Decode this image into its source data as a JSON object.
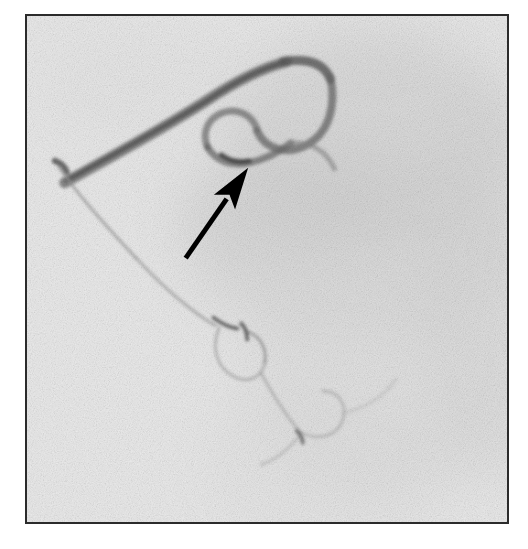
{
  "viewer": {
    "width": 528,
    "height": 549,
    "background_color": "#ffffff",
    "modality_label": "digital-subtraction-angiography"
  },
  "film": {
    "frame_left": 25,
    "frame_top": 14,
    "frame_width": 484,
    "frame_height": 510,
    "border_color": "#2b2b2b",
    "border_width": 2,
    "base_color": "#ececec",
    "grain_opacity": 0.38,
    "grain_seed": 20250817,
    "view_box": "0 0 484 510"
  },
  "soft_tissue_regions": [
    {
      "name": "upper-right-soft-tissue-shadow",
      "cx": 350,
      "cy": 120,
      "rx": 150,
      "ry": 110,
      "color": "#cfcfcf",
      "opacity": 0.55
    },
    {
      "name": "mid-right-soft-tissue-band",
      "cx": 330,
      "cy": 230,
      "rx": 175,
      "ry": 95,
      "color": "#d4d4d4",
      "opacity": 0.5
    },
    {
      "name": "lower-right-soft-tissue-mass",
      "cx": 360,
      "cy": 360,
      "rx": 140,
      "ry": 130,
      "color": "#dcdcdc",
      "opacity": 0.45
    },
    {
      "name": "right-margin-shadow",
      "cx": 470,
      "cy": 270,
      "rx": 80,
      "ry": 200,
      "color": "#d8d8d8",
      "opacity": 0.4
    },
    {
      "name": "central-diagonal-shadow",
      "cx": 255,
      "cy": 190,
      "rx": 110,
      "ry": 60,
      "color": "#d2d2d2",
      "opacity": 0.4
    },
    {
      "name": "lower-central-shadow",
      "cx": 300,
      "cy": 450,
      "rx": 120,
      "ry": 80,
      "color": "#e0e0e0",
      "opacity": 0.4
    },
    {
      "name": "upper-left-faint-shadow",
      "cx": 120,
      "cy": 70,
      "rx": 110,
      "ry": 55,
      "color": "#e2e2e2",
      "opacity": 0.35
    }
  ],
  "vessels": [
    {
      "name": "main-catheter-ascending-limb",
      "path": "M 38 168 C 70 150, 130 118, 180 86 C 210 66, 238 52, 262 46",
      "stroke": "#6e6e6e",
      "width": 11,
      "opacity": 0.78
    },
    {
      "name": "main-catheter-ascending-limb-core",
      "path": "M 40 166 C 72 148, 132 116, 182 85 C 212 65, 238 52, 260 47",
      "stroke": "#555555",
      "width": 5,
      "opacity": 0.8
    },
    {
      "name": "catheter-apex-curve",
      "path": "M 258 46 C 284 42, 300 48, 306 64",
      "stroke": "#5a5a5a",
      "width": 9,
      "opacity": 0.82
    },
    {
      "name": "catheter-descending-loop-outer",
      "path": "M 306 62 C 312 92, 304 118, 282 130 C 262 141, 240 134, 232 116",
      "stroke": "#6a6a6a",
      "width": 8,
      "opacity": 0.76
    },
    {
      "name": "catheter-inner-loop-return",
      "path": "M 232 114 C 226 98, 210 92, 196 98 C 182 104, 176 118, 182 132",
      "stroke": "#707070",
      "width": 7,
      "opacity": 0.72
    },
    {
      "name": "loop-junction-segment",
      "path": "M 182 132 C 190 146, 206 152, 224 148 C 242 144, 256 136, 266 128",
      "stroke": "#6b6b6b",
      "width": 7,
      "opacity": 0.74
    },
    {
      "name": "junction-dense-node",
      "path": "M 196 140 C 204 146, 214 148, 224 146",
      "stroke": "#3f3f3f",
      "width": 5,
      "opacity": 0.85
    },
    {
      "name": "distal-branch-from-junction",
      "path": "M 264 128 C 286 126, 302 136, 310 154",
      "stroke": "#888888",
      "width": 5,
      "opacity": 0.6
    },
    {
      "name": "left-proximal-dense-point",
      "path": "M 28 146 C 34 148, 38 152, 40 157",
      "stroke": "#4a4a4a",
      "width": 6,
      "opacity": 0.8
    },
    {
      "name": "thin-descending-vessel-upper",
      "path": "M 32 152 C 48 176, 78 210, 110 244",
      "stroke": "#9a9a9a",
      "width": 3,
      "opacity": 0.72
    },
    {
      "name": "thin-descending-vessel-lower",
      "path": "M 110 244 C 138 274, 166 298, 190 312",
      "stroke": "#9e9e9e",
      "width": 3,
      "opacity": 0.68
    },
    {
      "name": "vessel-branch-node-midline",
      "path": "M 188 304 C 196 310, 204 314, 212 315",
      "stroke": "#555555",
      "width": 4,
      "opacity": 0.8
    },
    {
      "name": "lower-loop-left-branch",
      "path": "M 194 314 C 186 332, 190 352, 206 362 C 222 372, 238 364, 240 348",
      "stroke": "#a5a5a5",
      "width": 3,
      "opacity": 0.65
    },
    {
      "name": "lower-loop-left-branch-return",
      "path": "M 240 348 C 242 334, 234 322, 222 318",
      "stroke": "#8e8e8e",
      "width": 3,
      "opacity": 0.7
    },
    {
      "name": "lower-branch-dense-marker",
      "path": "M 216 310 C 220 314, 222 320, 222 326",
      "stroke": "#4f4f4f",
      "width": 4,
      "opacity": 0.78
    },
    {
      "name": "lower-descending-trunk",
      "path": "M 236 360 C 248 382, 262 404, 276 420",
      "stroke": "#a8a8a8",
      "width": 3,
      "opacity": 0.62
    },
    {
      "name": "lower-loop-right-branch",
      "path": "M 276 420 C 294 428, 312 424, 318 408 C 324 392, 314 378, 298 378",
      "stroke": "#aaaaaa",
      "width": 3,
      "opacity": 0.6
    },
    {
      "name": "lower-terminal-branch",
      "path": "M 274 424 C 262 438, 250 448, 236 452",
      "stroke": "#b0b0b0",
      "width": 3,
      "opacity": 0.55
    },
    {
      "name": "lower-terminal-dense-point",
      "path": "M 272 418 C 276 422, 278 426, 278 430",
      "stroke": "#5c5c5c",
      "width": 4,
      "opacity": 0.72
    },
    {
      "name": "right-faint-collateral",
      "path": "M 318 400 C 340 396, 360 384, 372 366",
      "stroke": "#bbbbbb",
      "width": 3,
      "opacity": 0.45
    }
  ],
  "annotation": {
    "arrow": {
      "name": "pointer-arrow",
      "color": "#000000",
      "tail_x": 160,
      "tail_y": 244,
      "tip_x": 223,
      "tip_y": 153,
      "shaft_width": 5,
      "head_length": 42,
      "head_half_width": 13,
      "points_to": "loop-junction-segment"
    }
  }
}
